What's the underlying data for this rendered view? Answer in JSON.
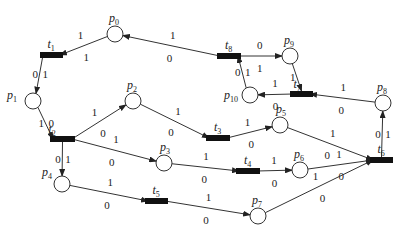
{
  "diagram": {
    "type": "petri-net",
    "places": [
      {
        "id": "p0",
        "label": "p",
        "sub": "0"
      },
      {
        "id": "p1",
        "label": "p",
        "sub": "1"
      },
      {
        "id": "p2",
        "label": "p",
        "sub": "2"
      },
      {
        "id": "p3",
        "label": "p",
        "sub": "3"
      },
      {
        "id": "p4",
        "label": "p",
        "sub": "4"
      },
      {
        "id": "p5",
        "label": "p",
        "sub": "5"
      },
      {
        "id": "p6",
        "label": "p",
        "sub": "6"
      },
      {
        "id": "p7",
        "label": "p",
        "sub": "7"
      },
      {
        "id": "p8",
        "label": "p",
        "sub": "8"
      },
      {
        "id": "p9",
        "label": "p",
        "sub": "9"
      },
      {
        "id": "p10",
        "label": "p",
        "sub": "10"
      }
    ],
    "transitions": [
      {
        "id": "t1",
        "label": "t",
        "sub": "1"
      },
      {
        "id": "t2",
        "label": "t",
        "sub": "2"
      },
      {
        "id": "t3",
        "label": "t",
        "sub": "3"
      },
      {
        "id": "t4",
        "label": "t",
        "sub": "4"
      },
      {
        "id": "t5",
        "label": "t",
        "sub": "5"
      },
      {
        "id": "t6",
        "label": "t",
        "sub": "6"
      },
      {
        "id": "t7",
        "label": "t",
        "sub": "7"
      },
      {
        "id": "t8",
        "label": "t",
        "sub": "8"
      }
    ],
    "arcs": [
      {
        "from": "t8",
        "to": "p0",
        "upper": "1",
        "lower": "0"
      },
      {
        "from": "p0",
        "to": "t1",
        "upper": "1",
        "lower": "1"
      },
      {
        "from": "t1",
        "to": "p1",
        "upper": "0",
        "lower": "1"
      },
      {
        "from": "p1",
        "to": "t2",
        "upper": "1",
        "lower": "0"
      },
      {
        "from": "t2",
        "to": "p2",
        "upper": "1",
        "lower": "0"
      },
      {
        "from": "p2",
        "to": "t3",
        "upper": "1",
        "lower": "0"
      },
      {
        "from": "t3",
        "to": "p5",
        "upper": "1",
        "lower": "0"
      },
      {
        "from": "p5",
        "to": "t6",
        "upper": "1",
        "lower": "0"
      },
      {
        "from": "t2",
        "to": "p3",
        "upper": "1",
        "lower": "0"
      },
      {
        "from": "p3",
        "to": "t4",
        "upper": "1",
        "lower": "0"
      },
      {
        "from": "t4",
        "to": "p6",
        "upper": "1",
        "lower": "0"
      },
      {
        "from": "p6",
        "to": "t6",
        "upper": "1",
        "lower": "0"
      },
      {
        "from": "t2",
        "to": "p4",
        "upper": "0",
        "lower": "1"
      },
      {
        "from": "p4",
        "to": "t5",
        "upper": "1",
        "lower": "0"
      },
      {
        "from": "t5",
        "to": "p7",
        "upper": "1",
        "lower": "0"
      },
      {
        "from": "p7",
        "to": "t6",
        "upper": "1",
        "lower": "0"
      },
      {
        "from": "t6",
        "to": "p8",
        "upper": "0",
        "lower": "1"
      },
      {
        "from": "p8",
        "to": "t7",
        "upper": "1",
        "lower": "0"
      },
      {
        "from": "t7",
        "to": "p10",
        "upper": "1",
        "lower": "0"
      },
      {
        "from": "p10",
        "to": "t8",
        "upper": "0",
        "lower": "1"
      },
      {
        "from": "t8",
        "to": "p9",
        "upper": "0",
        "lower": "1"
      },
      {
        "from": "p9",
        "to": "t7",
        "upper": "1",
        "lower": ""
      }
    ]
  }
}
